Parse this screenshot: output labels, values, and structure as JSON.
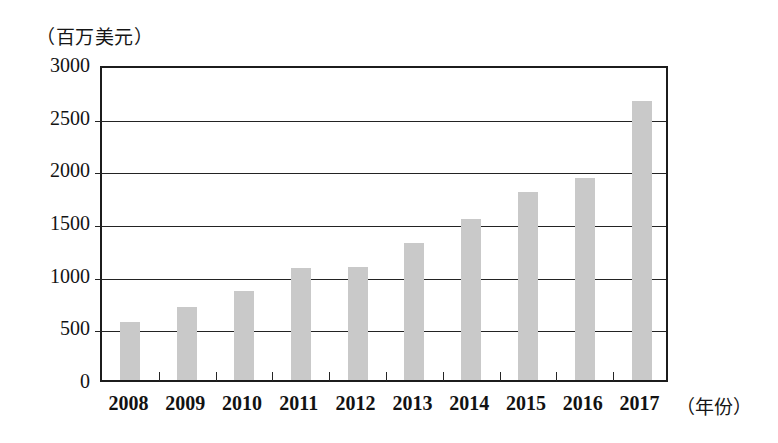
{
  "chart_data": {
    "type": "bar",
    "title": "",
    "subtitle": "",
    "xlabel": "（年份）",
    "ylabel": "（百万美元）",
    "categories": [
      "2008",
      "2009",
      "2010",
      "2011",
      "2012",
      "2013",
      "2014",
      "2015",
      "2016",
      "2017"
    ],
    "values": [
      550,
      690,
      845,
      1065,
      1075,
      1300,
      1530,
      1785,
      1920,
      2650
    ],
    "series": [
      {
        "name": "",
        "values": [
          550,
          690,
          845,
          1065,
          1075,
          1300,
          1530,
          1785,
          1920,
          2650
        ]
      }
    ],
    "ylim": [
      0,
      3000
    ],
    "ytick_labels": [
      "0",
      "500",
      "1000",
      "1500",
      "2000",
      "2500",
      "3000"
    ],
    "ytick_values": [
      0,
      500,
      1000,
      1500,
      2000,
      2500,
      3000
    ],
    "grid": "horizontal",
    "legend": "none",
    "bar_color": "#c9c9c9",
    "axis_color": "#1c1c1c",
    "background_color": "#ffffff"
  },
  "axes": {
    "y_unit_caption": "（百万美元）",
    "x_unit_caption": "（年份）"
  }
}
